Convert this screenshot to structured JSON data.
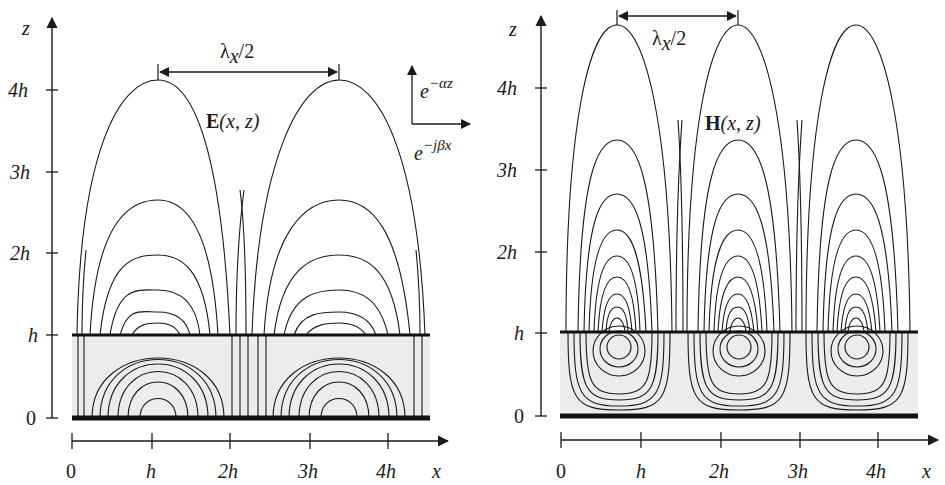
{
  "figure": {
    "colors": {
      "line": "#1a1a1a",
      "slab_fill": "#ececec",
      "background": "#ffffff"
    }
  },
  "left_panel": {
    "field_label_bold": "E",
    "field_label_args": "(x, z)",
    "z_axis_label": "z",
    "x_axis_label": "x",
    "z_ticks": [
      "0",
      "h",
      "2h",
      "3h",
      "4h"
    ],
    "x_ticks": [
      "0",
      "h",
      "2h",
      "3h",
      "4h"
    ],
    "dimension_label": "λ",
    "dimension_sub": "x",
    "dimension_tail": "/2",
    "decay_label_base": "e",
    "decay_label_exp": "−αz",
    "prop_label_base": "e",
    "prop_label_exp": "−jβx"
  },
  "right_panel": {
    "field_label_bold": "H",
    "field_label_args": "(x, z)",
    "z_axis_label": "z",
    "x_axis_label": "x",
    "z_ticks": [
      "0",
      "h",
      "2h",
      "3h",
      "4h"
    ],
    "x_ticks": [
      "0",
      "h",
      "2h",
      "3h",
      "4h"
    ],
    "dimension_label": "λ",
    "dimension_sub": "x",
    "dimension_tail": "/2"
  }
}
